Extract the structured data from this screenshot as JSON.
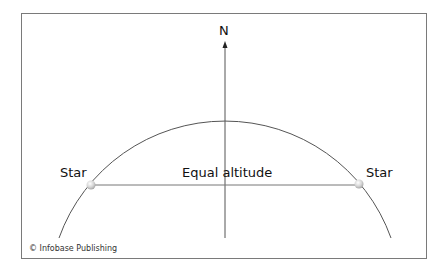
{
  "diagram": {
    "north_label": "N",
    "star_left_label": "Star",
    "star_right_label": "Star",
    "equal_altitude_label": "Equal altitude",
    "credit": "© Infobase Publishing"
  },
  "colors": {
    "line": "#555555",
    "frame": "#7a7a7a",
    "star": "#d8d8d8"
  }
}
